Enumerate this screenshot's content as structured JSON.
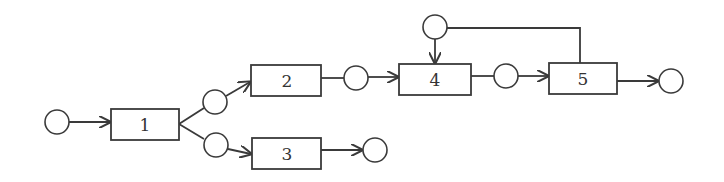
{
  "diagram": {
    "type": "process-flow-network",
    "activities": [
      {
        "id": "box1",
        "label": "1"
      },
      {
        "id": "box2",
        "label": "2"
      },
      {
        "id": "box3",
        "label": "3"
      },
      {
        "id": "box4",
        "label": "4"
      },
      {
        "id": "box5",
        "label": "5"
      }
    ],
    "nodes": [
      "circleA",
      "circleB",
      "circleC",
      "circleD",
      "circleE",
      "circleF",
      "circleG",
      "circleH"
    ],
    "edges": [
      {
        "from": "circleA",
        "to": "box1",
        "arrow": true
      },
      {
        "from": "box1",
        "to": "circleB",
        "arrow": false
      },
      {
        "from": "box1",
        "to": "circleC",
        "arrow": false
      },
      {
        "from": "circleB",
        "to": "box2",
        "arrow": true
      },
      {
        "from": "circleC",
        "to": "box3",
        "arrow": true
      },
      {
        "from": "box2",
        "to": "circleD",
        "arrow": false
      },
      {
        "from": "box3",
        "to": "circleE",
        "arrow": true
      },
      {
        "from": "circleD",
        "to": "box4",
        "arrow": true
      },
      {
        "from": "circleF",
        "to": "box4",
        "arrow": true
      },
      {
        "from": "box5",
        "to": "circleF",
        "arrow": false
      },
      {
        "from": "box4",
        "to": "circleG",
        "arrow": false
      },
      {
        "from": "circleG",
        "to": "box5",
        "arrow": true
      },
      {
        "from": "box5",
        "to": "circleH",
        "arrow": true
      }
    ]
  }
}
